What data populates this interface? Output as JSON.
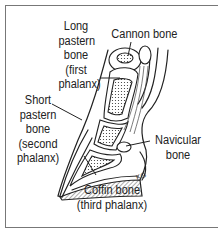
{
  "diagram": {
    "labels": {
      "long_pastern": [
        "Long",
        "pastern",
        "bone",
        "(first",
        "phalanx)"
      ],
      "cannon": [
        "Cannon bone"
      ],
      "short_pastern": [
        "Short",
        "pastern",
        "bone",
        "(second",
        "phalanx)"
      ],
      "navicular": [
        "Navicular",
        "bone"
      ],
      "coffin": [
        "Coffin bone",
        "(third phalanx)"
      ]
    },
    "signature": "KG",
    "colors": {
      "line": "#222222",
      "border": "#777777",
      "background": "#ffffff"
    }
  }
}
